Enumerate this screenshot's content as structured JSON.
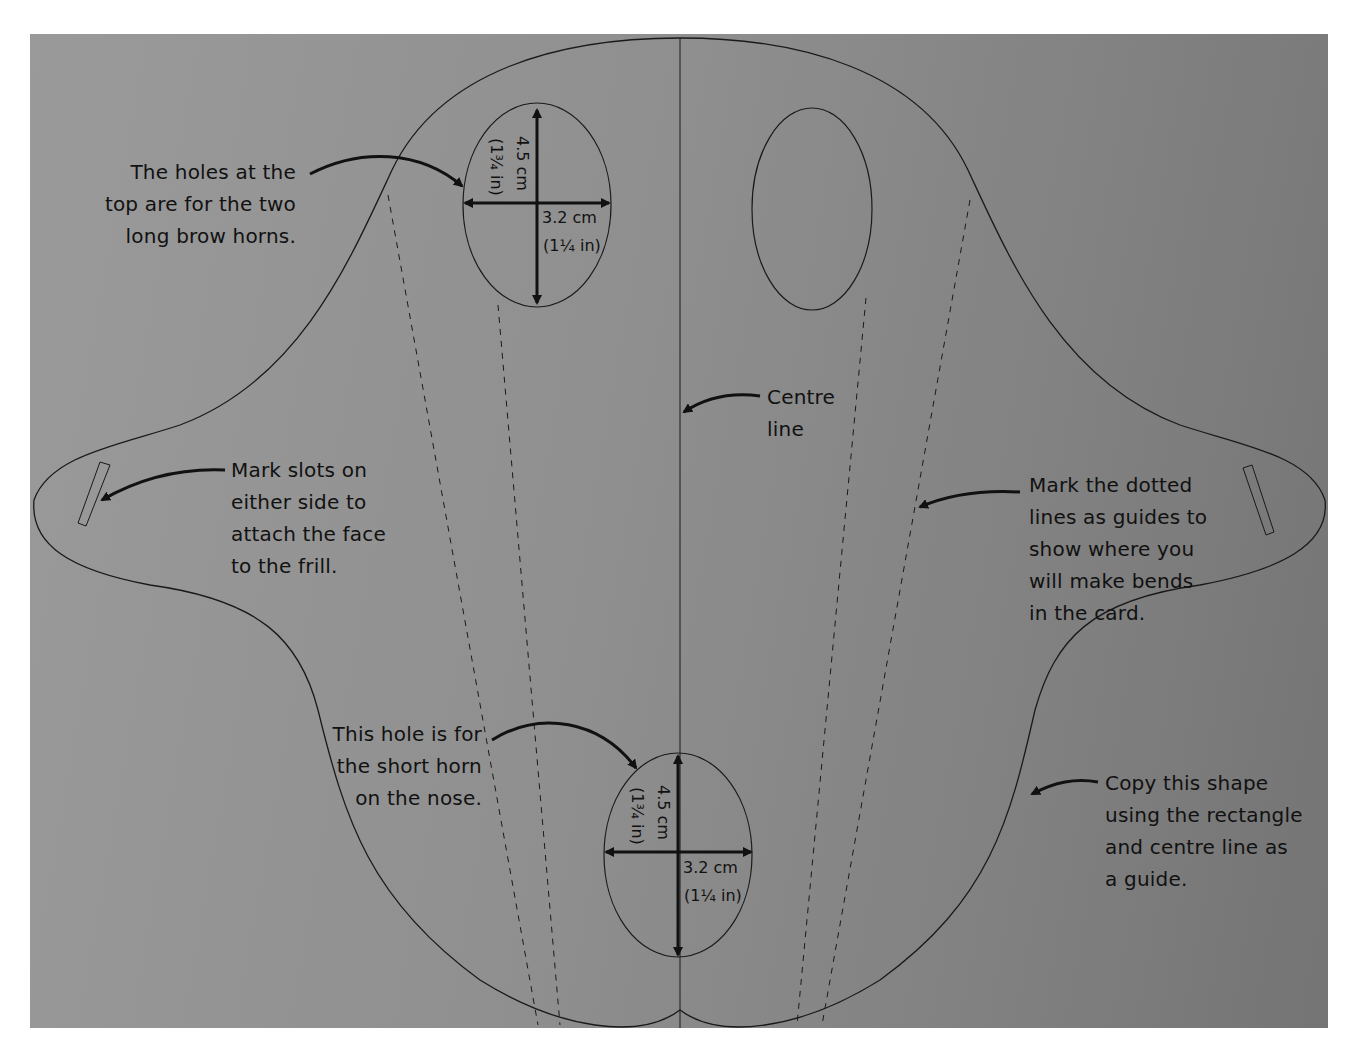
{
  "diagram": {
    "type": "craft template - triceratops face",
    "colors": {
      "card": "#8c8c8c",
      "ink": "#111111",
      "page": "#ffffff"
    }
  },
  "annotations": {
    "brow_horns": "The holes at the\ntop are for the two\nlong brow horns.",
    "slots": "Mark slots on\neither side to\nattach the face\nto the frill.",
    "centre_line": "Centre\nline",
    "dotted_lines": "Mark the dotted\nlines as guides to\nshow where you\nwill make bends\nin the card.",
    "nose_horn": "This hole is for\nthe short horn\non the nose.",
    "copy_shape": "Copy this shape\nusing the rectangle\nand centre line as\na guide."
  },
  "dimensions": {
    "top_hole": {
      "height_cm": "4.5 cm",
      "height_in": "(1¾ in)",
      "width_cm": "3.2 cm",
      "width_in": "(1¼ in)"
    },
    "nose_hole": {
      "height_cm": "4.5 cm",
      "height_in": "(1¾ in)",
      "width_cm": "3.2 cm",
      "width_in": "(1¼ in)"
    }
  }
}
